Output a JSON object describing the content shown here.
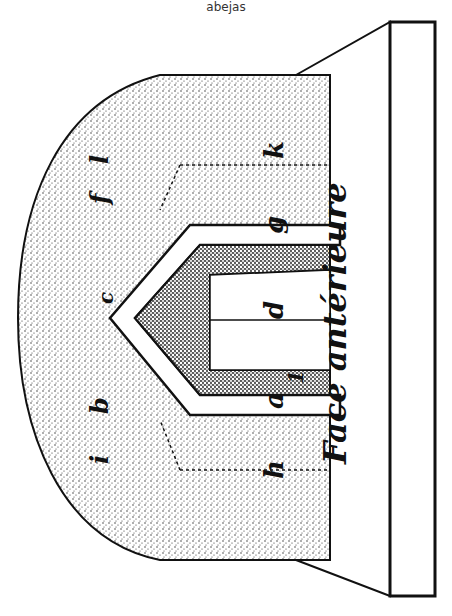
{
  "caption": "abejas",
  "figure": {
    "number_label": "Fig. 17",
    "face_label": "Face antérieure",
    "labels": {
      "apex": "e",
      "b": "b",
      "i": "i",
      "f": "f",
      "l": "l",
      "c": "c",
      "h": "h",
      "a": "a",
      "one": "1",
      "d": "d",
      "g": "g",
      "k": "k"
    },
    "colors": {
      "ink": "#111111",
      "paper": "#ffffff"
    }
  }
}
